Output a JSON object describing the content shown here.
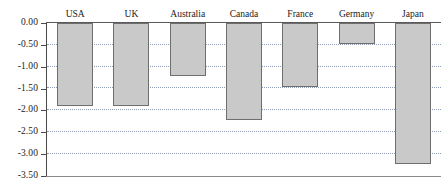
{
  "chart_data": {
    "type": "bar",
    "title": "",
    "subtitle": "",
    "xlabel": "",
    "ylabel": "",
    "categories": [
      "USA",
      "UK",
      "Australia",
      "Canada",
      "France",
      "Germany",
      "Japan"
    ],
    "values": [
      -1.9,
      -1.9,
      -1.22,
      -2.23,
      -1.47,
      -0.47,
      -3.23
    ],
    "series": [
      {
        "name": "",
        "values": [
          -1.9,
          -1.9,
          -1.22,
          -2.23,
          -1.47,
          -0.47,
          -3.23
        ]
      }
    ],
    "ylim": [
      -3.5,
      0.0
    ],
    "yticks": [
      0.0,
      -0.5,
      -1.0,
      -1.5,
      -2.0,
      -2.5,
      -3.0,
      -3.5
    ],
    "ytick_labels": [
      "0.00",
      "-0.50",
      "-1.00",
      "-1.50",
      "-2.00",
      "-2.50",
      "-3.00",
      "-3.50"
    ],
    "grid": true,
    "grid_style": "dotted",
    "legend": false,
    "legend_position": "none",
    "category_labels_position": "top",
    "annotations": []
  },
  "style": {
    "bar_fill": "#c9c9c9",
    "bar_border": "#6e6e6e",
    "grid_color": "#8f9db5",
    "axis_color": "#4a4a4a",
    "text_color": "#1a1a1a",
    "background": "#ffffff"
  }
}
